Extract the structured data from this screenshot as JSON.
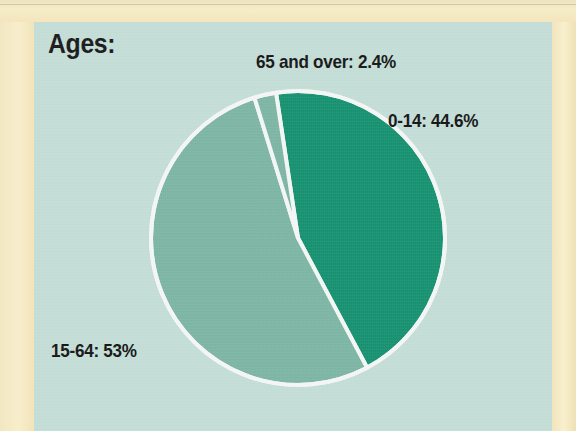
{
  "title": "Ages:",
  "colors": {
    "background_panel": "#c4ded7",
    "paper_border": "#f6eac4",
    "slice_dark_green": "#149170",
    "slice_light_sage": "#7cb5a4",
    "separator": "#f4f7f5",
    "label_text": "#131313"
  },
  "chart_data": {
    "type": "pie",
    "title": "Ages:",
    "xlabel": "",
    "ylabel": "",
    "categories": [
      "0-14",
      "15-64",
      "65 and over"
    ],
    "values": [
      44.6,
      53,
      2.4
    ],
    "labels": [
      "0-14: 44.6%",
      "15-64: 53%",
      "65 and over: 2.4%"
    ],
    "slice_colors": [
      "#149170",
      "#7cb5a4",
      "#7cb5a4"
    ],
    "unit": "%",
    "start_angle_deg": -8.6,
    "direction": "clockwise",
    "legend": "none",
    "grid": false,
    "geometry": {
      "center_x": 264,
      "center_y": 216,
      "radius": 147,
      "separator_width": 4
    }
  },
  "labels": {
    "slice_0_14": "0-14: 44.6%",
    "slice_15_64": "15-64: 53%",
    "slice_65_over": "65 and over: 2.4%"
  }
}
